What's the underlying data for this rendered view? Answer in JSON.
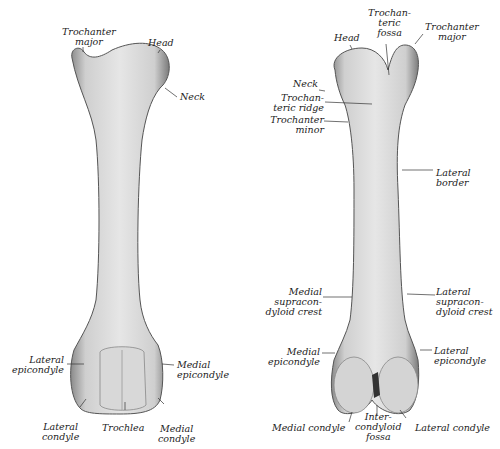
{
  "figure": {
    "anterior_view": {
      "labels": [
        {
          "id": "trochanter_major",
          "text": "Trochanter\nmajor"
        },
        {
          "id": "head",
          "text": "Head"
        },
        {
          "id": "neck",
          "text": "Neck"
        },
        {
          "id": "lateral_epicondyle",
          "text": "Lateral\nepicondyle"
        },
        {
          "id": "medial_epicondyle",
          "text": "Medial\nepicondyle"
        },
        {
          "id": "lateral_condyle",
          "text": "Lateral\ncondyle"
        },
        {
          "id": "trochlea",
          "text": "Trochlea"
        },
        {
          "id": "medial_condyle",
          "text": "Medial\ncondyle"
        }
      ]
    },
    "posterior_view": {
      "labels": [
        {
          "id": "head",
          "text": "Head"
        },
        {
          "id": "trochanteric_fossa",
          "text": "Trochan-\nteric\nfossa"
        },
        {
          "id": "trochanter_major",
          "text": "Trochanter\nmajor"
        },
        {
          "id": "neck",
          "text": "Neck"
        },
        {
          "id": "trochanteric_ridge",
          "text": "Trochan-\nteric ridge"
        },
        {
          "id": "trochanter_minor",
          "text": "Trochanter\nminor"
        },
        {
          "id": "lateral_border",
          "text": "Lateral\nborder"
        },
        {
          "id": "medial_supracondyloid_crest",
          "text": "Medial\nsupracon-\ndyloid crest"
        },
        {
          "id": "lateral_supracondyloid_crest",
          "text": "Lateral\nsupracon-\ndyloid crest"
        },
        {
          "id": "medial_epicondyle",
          "text": "Medial\nepicondyle"
        },
        {
          "id": "lateral_epicondyle",
          "text": "Lateral\nepicondyle"
        },
        {
          "id": "medial_condyle",
          "text": "Medial condyle"
        },
        {
          "id": "intercondyloid_fossa",
          "text": "Inter-\ncondyloid\nfossa"
        },
        {
          "id": "lateral_condyle",
          "text": "Lateral condyle"
        }
      ]
    }
  }
}
